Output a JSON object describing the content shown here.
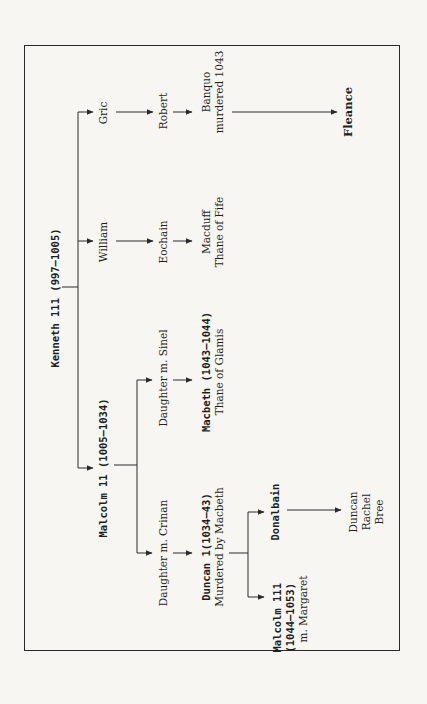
{
  "diagram": {
    "type": "family-tree",
    "orientation": "rotated-90-ccw",
    "colors": {
      "background": "#f7f6f3",
      "ink": "#1e1e1e",
      "frame": "#2a2a2a"
    },
    "nodes": {
      "kenneth": {
        "name": "Kenneth 111 (997–1005)"
      },
      "gric": {
        "name": "Gric"
      },
      "robert": {
        "name": "Robert"
      },
      "banquo": {
        "name": "Banquo",
        "note": "murdered 1043"
      },
      "fleance": {
        "name": "Fleance"
      },
      "william": {
        "name": "William"
      },
      "eochain": {
        "name": "Eochain"
      },
      "macduff": {
        "name": "Macduff",
        "note": "Thane of Fife"
      },
      "malcolm2": {
        "name": "Malcolm 11 (1005–1034)"
      },
      "daughter_sinel": {
        "name": "Daughter m. Sinel"
      },
      "macbeth": {
        "name": "Macbeth (1043–1044)",
        "note": "Thane of Glamis"
      },
      "daughter_crinan": {
        "name": "Daughter m. Crinan"
      },
      "duncan1": {
        "name": "Duncan 1(1034–43)",
        "note": "Murdered by Macbeth"
      },
      "malcolm3": {
        "name": "Malcolm 111",
        "dates": "(1044–1053)",
        "note": "m. Margaret"
      },
      "donalbain": {
        "name": "Donalbain"
      },
      "descendants": {
        "line1": "Duncan",
        "line2": "Rachel",
        "line3": "Bree"
      }
    },
    "edges": [
      [
        "kenneth",
        "gric"
      ],
      [
        "kenneth",
        "william"
      ],
      [
        "kenneth",
        "malcolm2"
      ],
      [
        "gric",
        "robert"
      ],
      [
        "robert",
        "banquo"
      ],
      [
        "banquo",
        "fleance"
      ],
      [
        "william",
        "eochain"
      ],
      [
        "eochain",
        "macduff"
      ],
      [
        "malcolm2",
        "daughter_sinel"
      ],
      [
        "malcolm2",
        "daughter_crinan"
      ],
      [
        "daughter_sinel",
        "macbeth"
      ],
      [
        "daughter_crinan",
        "duncan1"
      ],
      [
        "duncan1",
        "donalbain"
      ],
      [
        "duncan1",
        "malcolm3"
      ],
      [
        "donalbain",
        "descendants"
      ]
    ]
  }
}
